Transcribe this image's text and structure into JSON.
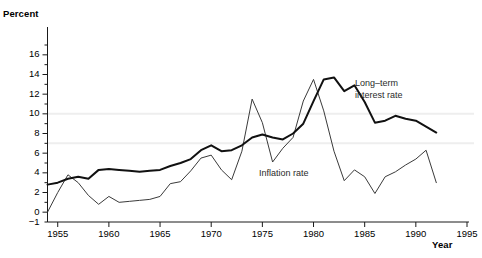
{
  "chart_data": {
    "type": "line",
    "title": "",
    "xlabel": "Year",
    "ylabel": "Percent",
    "xlim": [
      1954,
      1995
    ],
    "ylim": [
      -1,
      17
    ],
    "grid": "faint horizontal gridlines at 7 and 10",
    "legend_position": "inline annotations next to curves",
    "xticks": [
      1955,
      1960,
      1965,
      1970,
      1975,
      1980,
      1985,
      1990,
      1995
    ],
    "yticks": [
      -1,
      0,
      2,
      4,
      6,
      8,
      10,
      12,
      14,
      16
    ],
    "x": [
      1954,
      1955,
      1956,
      1957,
      1958,
      1959,
      1960,
      1961,
      1962,
      1963,
      1964,
      1965,
      1966,
      1967,
      1968,
      1969,
      1970,
      1971,
      1972,
      1973,
      1974,
      1975,
      1976,
      1977,
      1978,
      1979,
      1980,
      1981,
      1982,
      1983,
      1984,
      1985,
      1986,
      1987,
      1988,
      1989,
      1990,
      1991,
      1992
    ],
    "series": [
      {
        "name": "Long-term interest rate",
        "label": "Long–term\ninterest rate",
        "label_line1": "Long–term",
        "label_line2": "interest rate",
        "color": "#111111",
        "width": 2.0,
        "values": [
          2.8,
          3.0,
          3.4,
          3.6,
          3.4,
          4.3,
          4.4,
          4.3,
          4.2,
          4.1,
          4.2,
          4.3,
          4.7,
          5.0,
          5.4,
          6.3,
          6.8,
          6.2,
          6.3,
          6.8,
          7.6,
          7.9,
          7.6,
          7.4,
          8.0,
          9.0,
          11.3,
          13.5,
          13.7,
          12.3,
          12.9,
          11.2,
          9.1,
          9.3,
          9.8,
          9.5,
          9.3,
          8.7,
          8.1
        ],
        "peak_year": 1981,
        "peak_value": 13.7,
        "end_value": 8.1
      },
      {
        "name": "Inflation rate",
        "label": "Inflation rate",
        "color": "#3a3a3a",
        "width": 1.0,
        "values": [
          0.0,
          2.0,
          3.8,
          3.0,
          1.7,
          0.8,
          1.6,
          1.0,
          1.1,
          1.2,
          1.3,
          1.6,
          2.9,
          3.1,
          4.2,
          5.5,
          5.8,
          4.3,
          3.3,
          6.2,
          11.5,
          9.1,
          5.1,
          6.5,
          7.6,
          11.3,
          13.5,
          10.3,
          6.2,
          3.2,
          4.3,
          3.6,
          1.9,
          3.6,
          4.1,
          4.8,
          5.4,
          6.3,
          3.0
        ],
        "peak_year": 1980,
        "peak_value": 13.5,
        "end_value": 3.0
      }
    ]
  },
  "annotations": {
    "interest_label_x": 355,
    "interest_label_y": 78,
    "inflation_label_x": 259,
    "inflation_label_y": 168
  }
}
